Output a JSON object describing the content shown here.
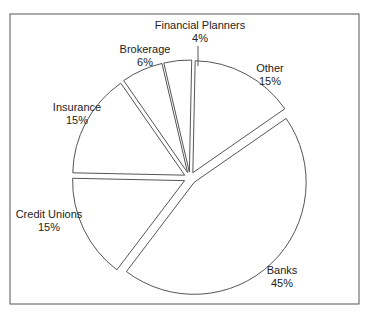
{
  "chart_data": {
    "type": "pie",
    "title": "",
    "exploded": true,
    "categories": [
      "Financial Planners",
      "Other",
      "Banks",
      "Credit Unions",
      "Insurance",
      "Brokerage"
    ],
    "values": [
      4,
      15,
      45,
      15,
      15,
      6
    ],
    "labels": [
      {
        "name": "Financial Planners",
        "pct": "4%"
      },
      {
        "name": "Other",
        "pct": "15%"
      },
      {
        "name": "Banks",
        "pct": "45%"
      },
      {
        "name": "Credit Unions",
        "pct": "15%"
      },
      {
        "name": "Insurance",
        "pct": "15%"
      },
      {
        "name": "Brokerage",
        "pct": "6%"
      }
    ],
    "legend": "none",
    "colors": {
      "fill": "#ffffff",
      "stroke": "#555555",
      "text": "#222222"
    }
  }
}
